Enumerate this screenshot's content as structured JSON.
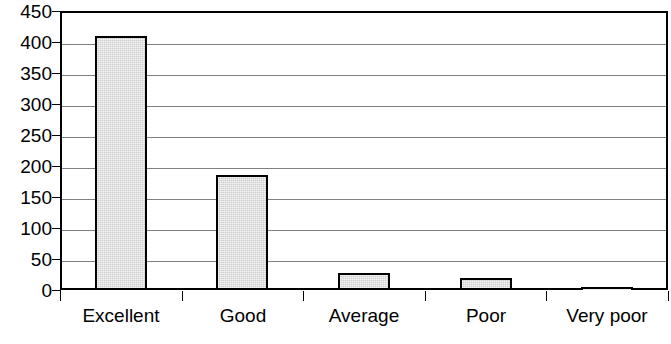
{
  "chart_data": {
    "type": "bar",
    "title": "",
    "subtitle": "",
    "xlabel": "",
    "ylabel": "",
    "categories": [
      "Excellent",
      "Good",
      "Average",
      "Poor",
      "Very poor"
    ],
    "values": [
      410,
      185,
      27,
      19,
      3
    ],
    "ylim": [
      0,
      450
    ],
    "ytick_step": 50,
    "ytick_labels": [
      "450",
      "400",
      "350",
      "300",
      "250",
      "200",
      "150",
      "100",
      "50",
      "0"
    ],
    "ytick_values": [
      450,
      400,
      350,
      300,
      250,
      200,
      150,
      100,
      50,
      0
    ],
    "grid": true,
    "grid_axis": "y",
    "legend": false,
    "legend_position": "none",
    "bar_fill_color": "#cccccc",
    "bar_border_color": "#000000",
    "gridline_color": "#808080",
    "axis_color": "#000000",
    "background_color": "#ffffff"
  }
}
